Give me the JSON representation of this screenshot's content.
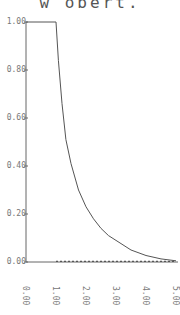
{
  "chart_data": {
    "type": "line",
    "title": "w obert.",
    "xlabel": "",
    "ylabel": "",
    "xlim": [
      0,
      5
    ],
    "ylim": [
      0,
      1
    ],
    "grid": false,
    "legend": null,
    "x_ticks": [
      "0.00",
      "1.00",
      "2.00",
      "3.00",
      "4.00",
      "5.00"
    ],
    "y_ticks": [
      "0.00",
      "0.20",
      "0.40",
      "0.60",
      "0.80",
      "1.00"
    ],
    "series": [
      {
        "name": "solid curve",
        "style": "solid",
        "x": [
          0,
          1.0,
          1.08,
          1.2,
          1.33,
          1.5,
          1.75,
          2.0,
          2.25,
          2.5,
          2.75,
          3.0,
          3.5,
          4.0,
          4.5,
          5.0
        ],
        "y": [
          1.0,
          1.0,
          0.84,
          0.66,
          0.51,
          0.41,
          0.3,
          0.23,
          0.18,
          0.14,
          0.11,
          0.09,
          0.05,
          0.027,
          0.013,
          0.005
        ]
      },
      {
        "name": "dashed baseline",
        "style": "dashed",
        "x": [
          1.0,
          5.0
        ],
        "y": [
          0.003,
          0.003
        ]
      }
    ]
  },
  "plot": {
    "left_px": 26,
    "right_px": 176,
    "top_px": 22,
    "bottom_px": 262,
    "line_color": "#555555"
  }
}
